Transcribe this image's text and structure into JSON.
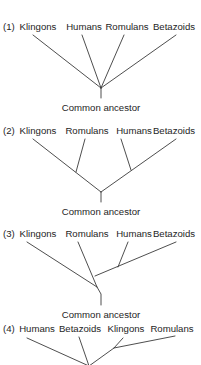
{
  "diagram": {
    "type": "phylogenetic-trees",
    "ancestor_label": "Common ancestor",
    "line_color": "#3a3a3a",
    "text_color": "#1e1e1e",
    "trees": [
      {
        "id": "1",
        "number_label": "(1)",
        "taxa": [
          "Klingons",
          "Humans",
          "Romulans",
          "Betazoids"
        ],
        "structure": "polytomy: all four taxa diverge from one common ancestor"
      },
      {
        "id": "2",
        "number_label": "(2)",
        "taxa": [
          "Klingons",
          "Romulans",
          "Humans",
          "Betazoids"
        ],
        "structure": "((Klingons, Romulans), (Humans, Betazoids))"
      },
      {
        "id": "3",
        "number_label": "(3)",
        "taxa": [
          "Klingons",
          "Romulans",
          "Humans",
          "Betazoids"
        ],
        "structure": "(Klingons, (Romulans, (Humans, Betazoids)))"
      },
      {
        "id": "4",
        "number_label": "(4)",
        "taxa": [
          "Humans",
          "Betazoids",
          "Klingons",
          "Romulans"
        ],
        "structure": "(Humans, Betazoids, (Klingons, Romulans))"
      }
    ]
  }
}
